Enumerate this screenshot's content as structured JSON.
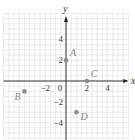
{
  "chart_data": {
    "type": "scatter",
    "title": "",
    "xlabel": "x",
    "ylabel": "y",
    "xlim": [
      -6,
      6
    ],
    "ylim": [
      -5.5,
      6.5
    ],
    "grid": true,
    "grid_step": 0.5,
    "x_ticks": [
      {
        "value": -2,
        "label": "−2"
      },
      {
        "value": 0,
        "label": "0"
      },
      {
        "value": 2,
        "label": "2"
      },
      {
        "value": 4,
        "label": "4"
      }
    ],
    "y_ticks": [
      {
        "value": 4,
        "label": "4"
      },
      {
        "value": 2,
        "label": "2"
      },
      {
        "value": -2,
        "label": "−2"
      },
      {
        "value": -4,
        "label": "−4"
      }
    ],
    "points": [
      {
        "label": "A",
        "x": 0,
        "y": 2
      },
      {
        "label": "B",
        "x": -4,
        "y": -1
      },
      {
        "label": "C",
        "x": 2,
        "y": 0
      },
      {
        "label": "D",
        "x": 1,
        "y": -3
      }
    ],
    "colors": {
      "grid": "#dcdcdc",
      "axis": "#222222",
      "point": "#8c8c8c",
      "point_label": "#8a8a8a"
    }
  }
}
